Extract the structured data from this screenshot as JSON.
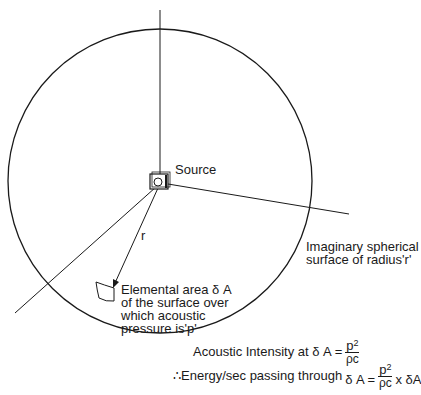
{
  "diagram": {
    "labels": {
      "source": "Source",
      "radius": "r",
      "surface_line1": "Imaginary spherical",
      "surface_line2": "surface of radius'r'",
      "element_line1": "Elemental area δ A",
      "element_line2": "of the surface over",
      "element_line3": "which acoustic",
      "element_line4": "pressure is'p'"
    },
    "equations": {
      "intensity_prefix": "Acoustic Intensity at δ A =",
      "intensity_num": "p",
      "intensity_exp": "2",
      "intensity_den": "ρc",
      "energy_prefix": "∴Energy/sec passing through",
      "energy_lhs": "δ A =",
      "energy_num": "p",
      "energy_exp": "2",
      "energy_den": "ρc",
      "energy_suffix": "x δA"
    },
    "colors": {
      "stroke": "#1a1a1a",
      "background": "#ffffff"
    }
  }
}
